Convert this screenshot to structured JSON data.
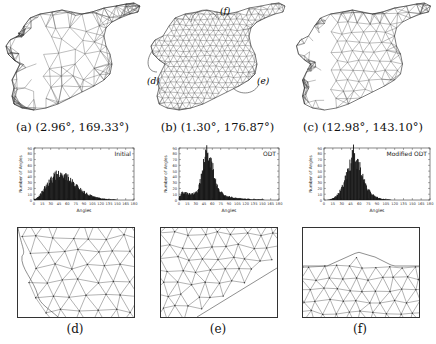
{
  "figure": {
    "top_row": [
      {
        "id": "a",
        "caption": "(a) (2.96°, 169.33°)",
        "label": "(a)",
        "min_angle": "2.96°",
        "max_angle": "169.33°",
        "mesh_style": "initial-coarse"
      },
      {
        "id": "b",
        "caption": "(b) (1.30°, 176.87°)",
        "label": "(b)",
        "min_angle": "1.30°",
        "max_angle": "176.87°",
        "mesh_style": "odt-uniform",
        "callouts": [
          "(f)",
          "(d)",
          "(e)"
        ]
      },
      {
        "id": "c",
        "caption": "(c) (12.98°, 143.10°)",
        "label": "(c)",
        "min_angle": "12.98°",
        "max_angle": "143.10°",
        "mesh_style": "modified-odt"
      }
    ],
    "bottom_row": [
      {
        "id": "d",
        "caption": "(d)"
      },
      {
        "id": "e",
        "caption": "(e)"
      },
      {
        "id": "f",
        "caption": "(f)"
      }
    ]
  },
  "chart_data": [
    {
      "type": "bar",
      "title": "Initial",
      "xlabel": "Angles",
      "ylabel": "Number of Angles",
      "xlim": [
        0,
        180
      ],
      "ylim": [
        0,
        90
      ],
      "x_ticks": [
        "0",
        "15",
        "30",
        "45",
        "60",
        "75",
        "90",
        "105",
        "120",
        "135",
        "150",
        "165",
        "180"
      ],
      "y_ticks": [
        "0",
        "10",
        "20",
        "30",
        "40",
        "50",
        "60",
        "70",
        "80",
        "90"
      ],
      "x": [
        5,
        10,
        15,
        20,
        25,
        30,
        35,
        40,
        45,
        50,
        55,
        60,
        65,
        70,
        75,
        80,
        85,
        90,
        95,
        100,
        105,
        110,
        115,
        120,
        125,
        130,
        135,
        140,
        145,
        150,
        155,
        160,
        165,
        170,
        175
      ],
      "values": [
        1,
        3,
        8,
        15,
        22,
        28,
        34,
        38,
        45,
        42,
        40,
        44,
        38,
        34,
        30,
        25,
        22,
        18,
        14,
        11,
        9,
        7,
        5,
        4,
        3,
        2,
        2,
        1,
        1,
        1,
        0,
        0,
        0,
        0,
        0
      ]
    },
    {
      "type": "bar",
      "title": "ODT",
      "xlabel": "Angles",
      "ylabel": "Number of Angles",
      "xlim": [
        0,
        180
      ],
      "ylim": [
        0,
        90
      ],
      "x_ticks": [
        "0",
        "15",
        "30",
        "45",
        "60",
        "75",
        "90",
        "105",
        "120",
        "135",
        "150",
        "165",
        "180"
      ],
      "y_ticks": [
        "5",
        "15",
        "25",
        "35",
        "45",
        "55",
        "65",
        "75",
        "85"
      ],
      "x": [
        5,
        10,
        15,
        20,
        25,
        30,
        35,
        40,
        45,
        50,
        55,
        60,
        65,
        70,
        75,
        80,
        85,
        90,
        95,
        100,
        105,
        110,
        115,
        120,
        125,
        130,
        135,
        140,
        145,
        150,
        155,
        160,
        165,
        170,
        175
      ],
      "values": [
        4,
        12,
        13,
        12,
        10,
        11,
        12,
        18,
        40,
        65,
        82,
        72,
        58,
        35,
        20,
        14,
        10,
        7,
        6,
        5,
        4,
        3,
        3,
        2,
        2,
        2,
        1,
        1,
        1,
        1,
        1,
        0,
        0,
        0,
        0
      ]
    },
    {
      "type": "bar",
      "title": "Modified ODT",
      "xlabel": "Angles",
      "ylabel": "Number of Angles",
      "xlim": [
        0,
        180
      ],
      "ylim": [
        0,
        90
      ],
      "x_ticks": [
        "0",
        "15",
        "30",
        "45",
        "60",
        "75",
        "90",
        "105",
        "120",
        "135",
        "150",
        "165",
        "180"
      ],
      "y_ticks": [
        "5",
        "15",
        "25",
        "35",
        "45",
        "55",
        "65",
        "75",
        "85"
      ],
      "x": [
        5,
        10,
        15,
        20,
        25,
        30,
        35,
        40,
        45,
        50,
        55,
        60,
        65,
        70,
        75,
        80,
        85,
        90,
        95,
        100,
        105,
        110,
        115,
        120,
        125,
        130,
        135,
        140,
        145,
        150,
        155,
        160,
        165,
        170,
        175
      ],
      "values": [
        0,
        0,
        1,
        3,
        6,
        12,
        20,
        32,
        48,
        62,
        83,
        68,
        58,
        42,
        28,
        18,
        12,
        8,
        5,
        3,
        2,
        1,
        1,
        0,
        0,
        0,
        0,
        0,
        0,
        0,
        0,
        0,
        0,
        0,
        0
      ]
    }
  ]
}
